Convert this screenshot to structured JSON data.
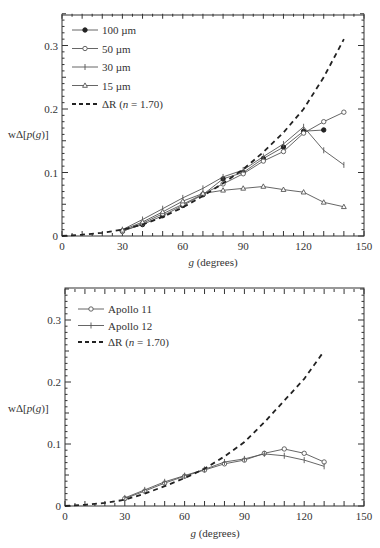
{
  "chart_data": [
    {
      "type": "line",
      "title": "",
      "xlabel": "g (degrees)",
      "ylabel": "wΔ[p(g)]",
      "xlim": [
        0,
        150
      ],
      "ylim": [
        0,
        0.35
      ],
      "x_ticks": [
        "0",
        "30",
        "60",
        "90",
        "120",
        "150"
      ],
      "y_ticks": [
        "0",
        "0.1",
        "0.2",
        "0.3"
      ],
      "grid": false,
      "legend_position": "upper-left",
      "series": [
        {
          "name": "100 µm",
          "marker": "filled-circle",
          "style": "solid",
          "x": [
            30,
            40,
            50,
            60,
            70,
            80,
            90,
            100,
            110,
            120,
            130
          ],
          "y": [
            0.008,
            0.018,
            0.032,
            0.048,
            0.065,
            0.09,
            0.1,
            0.122,
            0.14,
            0.165,
            0.167
          ]
        },
        {
          "name": "50 µm",
          "marker": "open-circle",
          "style": "solid",
          "x": [
            30,
            40,
            50,
            60,
            70,
            80,
            90,
            100,
            110,
            120,
            130,
            140
          ],
          "y": [
            0.007,
            0.02,
            0.035,
            0.05,
            0.066,
            0.082,
            0.098,
            0.118,
            0.133,
            0.162,
            0.18,
            0.195
          ]
        },
        {
          "name": "30 µm",
          "marker": "plus",
          "style": "solid",
          "x": [
            30,
            40,
            50,
            60,
            70,
            80,
            90,
            100,
            110,
            120,
            130,
            140
          ],
          "y": [
            0.01,
            0.026,
            0.043,
            0.06,
            0.075,
            0.093,
            0.104,
            0.125,
            0.145,
            0.172,
            0.135,
            0.112
          ]
        },
        {
          "name": "15 µm",
          "marker": "triangle",
          "style": "solid",
          "x": [
            30,
            40,
            50,
            60,
            70,
            80,
            90,
            100,
            110,
            120,
            130,
            140
          ],
          "y": [
            0.009,
            0.022,
            0.038,
            0.055,
            0.067,
            0.072,
            0.075,
            0.078,
            0.073,
            0.069,
            0.053,
            0.046
          ]
        },
        {
          "name": "ΔR (n = 1.70)",
          "marker": "none",
          "style": "dashed",
          "x": [
            0,
            10,
            20,
            30,
            40,
            50,
            60,
            70,
            80,
            90,
            100,
            110,
            120,
            130,
            140
          ],
          "y": [
            0.0,
            0.002,
            0.005,
            0.01,
            0.018,
            0.03,
            0.045,
            0.063,
            0.083,
            0.105,
            0.132,
            0.163,
            0.2,
            0.25,
            0.31
          ]
        }
      ]
    },
    {
      "type": "line",
      "title": "",
      "xlabel": "g (degrees)",
      "ylabel": "wΔ[p(g)]",
      "xlim": [
        0,
        150
      ],
      "ylim": [
        0,
        0.35
      ],
      "x_ticks": [
        "0",
        "30",
        "60",
        "90",
        "120",
        "150"
      ],
      "y_ticks": [
        "0",
        "0.1",
        "0.2",
        "0.3"
      ],
      "grid": false,
      "legend_position": "upper-left",
      "series": [
        {
          "name": "Apollo 11",
          "marker": "open-circle",
          "style": "solid",
          "x": [
            30,
            40,
            50,
            60,
            70,
            80,
            90,
            100,
            110,
            120,
            130
          ],
          "y": [
            0.012,
            0.024,
            0.037,
            0.048,
            0.058,
            0.068,
            0.074,
            0.085,
            0.092,
            0.085,
            0.071
          ]
        },
        {
          "name": "Apollo 12",
          "marker": "plus",
          "style": "solid",
          "x": [
            30,
            40,
            50,
            60,
            70,
            80,
            90,
            100,
            110,
            120,
            130
          ],
          "y": [
            0.013,
            0.026,
            0.039,
            0.049,
            0.059,
            0.071,
            0.076,
            0.084,
            0.081,
            0.074,
            0.064
          ]
        },
        {
          "name": "ΔR (n = 1.70)",
          "marker": "none",
          "style": "dashed",
          "x": [
            0,
            10,
            20,
            30,
            40,
            50,
            60,
            70,
            80,
            90,
            100,
            110,
            120,
            130
          ],
          "y": [
            0.0,
            0.002,
            0.005,
            0.01,
            0.02,
            0.032,
            0.045,
            0.06,
            0.08,
            0.103,
            0.135,
            0.17,
            0.205,
            0.25
          ]
        }
      ]
    }
  ],
  "charts": [
    {
      "ylabel_prefix": "wΔ[",
      "ylabel_p": "p",
      "ylabel_mid": "(",
      "ylabel_g": "g",
      "ylabel_suffix": ")]",
      "xlabel_g": "g",
      "xlabel_rest": " (degrees)",
      "legend": [
        {
          "label": "100 µm"
        },
        {
          "label": "50 µm"
        },
        {
          "label": "30 µm"
        },
        {
          "label": "15 µm"
        },
        {
          "label_prefix": "ΔR (",
          "label_n": "n",
          "label_suffix": " = 1.70)"
        }
      ]
    },
    {
      "ylabel_prefix": "wΔ[",
      "ylabel_p": "p",
      "ylabel_mid": "(",
      "ylabel_g": "g",
      "ylabel_suffix": ")]",
      "xlabel_g": "g",
      "xlabel_rest": " (degrees)",
      "legend": [
        {
          "label": "Apollo 11"
        },
        {
          "label": "Apollo 12"
        },
        {
          "label_prefix": "ΔR (",
          "label_n": "n",
          "label_suffix": " = 1.70)"
        }
      ]
    }
  ],
  "colors": {
    "axis": "#333333",
    "solid_line": "#555555",
    "dashed_line": "#222222"
  }
}
